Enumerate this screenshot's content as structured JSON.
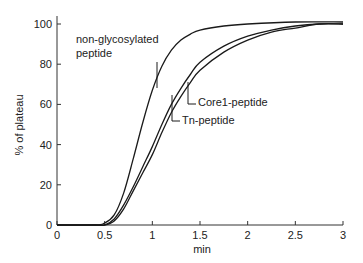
{
  "chart_data": {
    "type": "line",
    "title": "",
    "xlabel": "min",
    "ylabel": "% of plateau",
    "xlim": [
      0,
      3
    ],
    "ylim": [
      0,
      105
    ],
    "xticks": [
      0,
      0.5,
      1,
      1.5,
      2,
      2.5,
      3
    ],
    "xtick_labels": [
      "0",
      "0.5",
      "1",
      "1.5",
      "2",
      "2.5",
      "3"
    ],
    "yticks": [
      0,
      20,
      40,
      60,
      80,
      100
    ],
    "ytick_labels": [
      "0",
      "20",
      "40",
      "60",
      "80",
      "100"
    ],
    "grid": false,
    "legend": "inline annotations",
    "series": [
      {
        "name": "non-glycosylated peptide",
        "x": [
          0,
          0.4,
          0.5,
          0.6,
          0.7,
          0.8,
          0.9,
          1.0,
          1.1,
          1.2,
          1.3,
          1.4,
          1.5,
          1.75,
          2.0,
          2.5,
          3.0
        ],
        "values": [
          0,
          0,
          1,
          5,
          16,
          33,
          51,
          67,
          79,
          87,
          92,
          95,
          97,
          99,
          100,
          101,
          101
        ]
      },
      {
        "name": "Core1-peptide",
        "x": [
          0,
          0.4,
          0.5,
          0.6,
          0.7,
          0.8,
          0.9,
          1.0,
          1.1,
          1.2,
          1.3,
          1.4,
          1.5,
          1.75,
          2.0,
          2.25,
          2.5,
          2.75,
          3.0
        ],
        "values": [
          0,
          0,
          0,
          3,
          10,
          19,
          29,
          39,
          50,
          60,
          68,
          75,
          81,
          89,
          94,
          97,
          99,
          100,
          100
        ]
      },
      {
        "name": "Tn-peptide",
        "x": [
          0,
          0.4,
          0.5,
          0.6,
          0.7,
          0.8,
          0.9,
          1.0,
          1.1,
          1.2,
          1.3,
          1.4,
          1.5,
          1.75,
          2.0,
          2.25,
          2.5,
          2.75,
          3.0
        ],
        "values": [
          0,
          0,
          0,
          2,
          8,
          17,
          26,
          35,
          46,
          56,
          64,
          71,
          77,
          86,
          92,
          96,
          98,
          100,
          100
        ]
      }
    ],
    "annotations": [
      {
        "text_lines": [
          "non-glycosylated",
          "peptide"
        ],
        "points_to": "non-glycosylated peptide"
      },
      {
        "text_lines": [
          "Core1-peptide"
        ],
        "points_to": "Core1-peptide"
      },
      {
        "text_lines": [
          "Tn-peptide"
        ],
        "points_to": "Tn-peptide"
      }
    ]
  },
  "colors": {
    "line": "#1a1a1a",
    "axis": "#333333"
  }
}
